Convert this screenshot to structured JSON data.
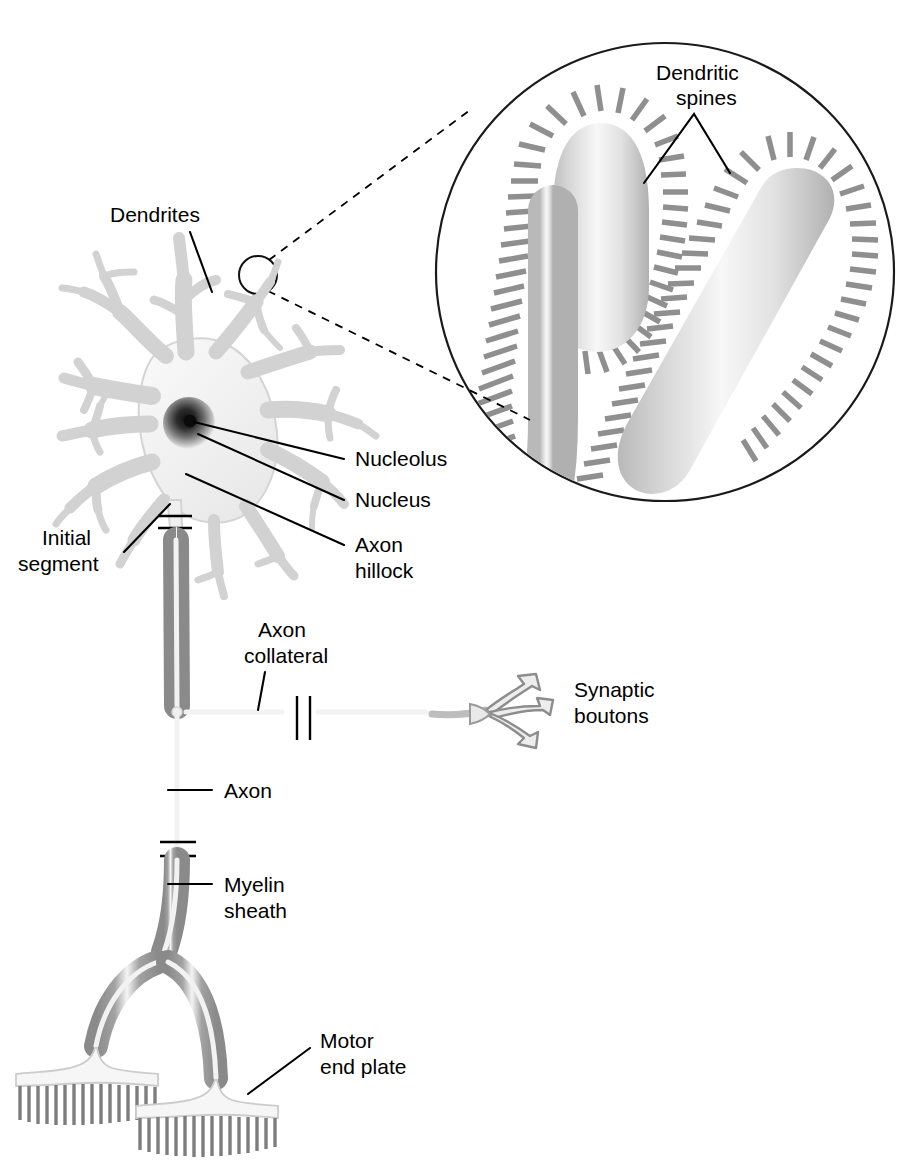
{
  "figure": {
    "background_color": "#ffffff",
    "width": 911,
    "height": 1162
  },
  "labels": {
    "dendrites": "Dendrites",
    "dendritic_spines_line1": "Dendritic",
    "dendritic_spines_line2": "spines",
    "nucleolus": "Nucleolus",
    "nucleus": "Nucleus",
    "axon_hillock_line1": "Axon",
    "axon_hillock_line2": "hillock",
    "initial_segment_line1": "Initial",
    "initial_segment_line2": "segment",
    "axon_collateral_line1": "Axon",
    "axon_collateral_line2": "collateral",
    "synaptic_boutons_line1": "Synaptic",
    "synaptic_boutons_line2": "boutons",
    "axon": "Axon",
    "myelin_sheath_line1": "Myelin",
    "myelin_sheath_line2": "sheath",
    "motor_end_plate_line1": "Motor",
    "motor_end_plate_line2": "end plate"
  },
  "parts": [
    {
      "id": "dendrites",
      "name": "Dendrites"
    },
    {
      "id": "dendritic-spines",
      "name": "Dendritic spines"
    },
    {
      "id": "nucleolus",
      "name": "Nucleolus"
    },
    {
      "id": "nucleus",
      "name": "Nucleus"
    },
    {
      "id": "axon-hillock",
      "name": "Axon hillock"
    },
    {
      "id": "initial-segment",
      "name": "Initial segment"
    },
    {
      "id": "axon-collateral",
      "name": "Axon collateral"
    },
    {
      "id": "synaptic-boutons",
      "name": "Synaptic boutons"
    },
    {
      "id": "axon",
      "name": "Axon"
    },
    {
      "id": "myelin-sheath",
      "name": "Myelin sheath"
    },
    {
      "id": "motor-end-plate",
      "name": "Motor end plate"
    }
  ],
  "colors": {
    "ink": "#000000",
    "dendrite_outline": "#cfcfcf",
    "dendrite_fill": "#f2f2f2",
    "myelin": "#8b8b8b",
    "spine": "#8f8f8f",
    "nucleus": "#6b6b6b",
    "nucleolus": "#111111",
    "end_plate_fibre": "#7d7d7d",
    "background": "#ffffff"
  }
}
